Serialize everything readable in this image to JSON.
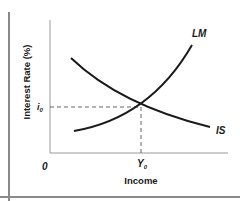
{
  "diagram": {
    "y_axis_label": "Interest Rate (%)",
    "x_axis_label": "Income",
    "origin_label": "0",
    "equilibrium": {
      "rate_label": "i",
      "rate_subscript": "0",
      "income_label": "Y",
      "income_subscript": "0"
    },
    "curves": [
      {
        "name": "IS",
        "label": "IS",
        "slope": "downward"
      },
      {
        "name": "LM",
        "label": "LM",
        "slope": "upward"
      }
    ],
    "colors": {
      "curve": "#1a1a1a",
      "axis": "#8a8a8a",
      "frame": "#8a8a8a",
      "dashed": "#555555"
    }
  }
}
